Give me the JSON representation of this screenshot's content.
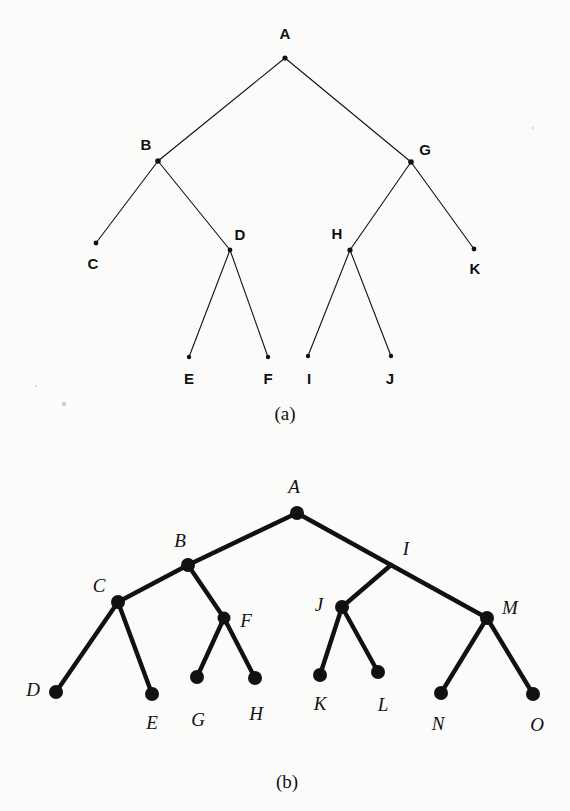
{
  "figure": {
    "background_color": "#fbfbfa",
    "ink_color": "#111111"
  },
  "panel_a": {
    "caption": "(a)",
    "caption_x": 285,
    "caption_y": 414,
    "style": "thin-lines-bold-sans-labels",
    "nodes": [
      {
        "id": "A",
        "label": "A",
        "x": 285,
        "y": 58,
        "label_x": 285,
        "label_y": 33,
        "dot_r": 2.6
      },
      {
        "id": "B",
        "label": "B",
        "x": 158,
        "y": 161,
        "label_x": 146,
        "label_y": 144,
        "dot_r": 2.8
      },
      {
        "id": "G",
        "label": "G",
        "x": 411,
        "y": 162,
        "label_x": 425,
        "label_y": 149,
        "dot_r": 2.8
      },
      {
        "id": "C",
        "label": "C",
        "x": 96,
        "y": 243,
        "label_x": 93,
        "label_y": 263,
        "dot_r": 2.4
      },
      {
        "id": "D",
        "label": "D",
        "x": 230,
        "y": 250,
        "label_x": 240,
        "label_y": 234,
        "dot_r": 2.4
      },
      {
        "id": "H",
        "label": "H",
        "x": 350,
        "y": 250,
        "label_x": 337,
        "label_y": 233,
        "dot_r": 2.6
      },
      {
        "id": "K",
        "label": "K",
        "x": 474,
        "y": 249,
        "label_x": 475,
        "label_y": 268,
        "dot_r": 2.4
      },
      {
        "id": "E",
        "label": "E",
        "x": 189,
        "y": 357,
        "label_x": 189,
        "label_y": 378,
        "dot_r": 2.2
      },
      {
        "id": "F",
        "label": "F",
        "x": 268,
        "y": 357,
        "label_x": 268,
        "label_y": 378,
        "dot_r": 2.2
      },
      {
        "id": "I",
        "label": "I",
        "x": 308,
        "y": 356,
        "label_x": 309,
        "label_y": 378,
        "dot_r": 2.2
      },
      {
        "id": "J",
        "label": "J",
        "x": 391,
        "y": 356,
        "label_x": 390,
        "label_y": 378,
        "dot_r": 2.2
      }
    ],
    "edges": [
      [
        "A",
        "B"
      ],
      [
        "A",
        "G"
      ],
      [
        "B",
        "C"
      ],
      [
        "B",
        "D"
      ],
      [
        "G",
        "H"
      ],
      [
        "G",
        "K"
      ],
      [
        "D",
        "E"
      ],
      [
        "D",
        "F"
      ],
      [
        "H",
        "I"
      ],
      [
        "H",
        "J"
      ]
    ],
    "edge_width": 1.1
  },
  "panel_b": {
    "caption": "(b)",
    "caption_x": 287,
    "caption_y": 782,
    "style": "thick-lines-italic-serif-labels",
    "nodes": [
      {
        "id": "A",
        "label": "A",
        "x": 297,
        "y": 513,
        "label_x": 294,
        "label_y": 486,
        "dot_r": 7.0
      },
      {
        "id": "B",
        "label": "B",
        "x": 188,
        "y": 565,
        "label_x": 180,
        "label_y": 540,
        "dot_r": 7.0
      },
      {
        "id": "I",
        "label": "I",
        "x": 391,
        "y": 565,
        "label_x": 406,
        "label_y": 548,
        "dot_r": 0.0
      },
      {
        "id": "C",
        "label": "C",
        "x": 118,
        "y": 602,
        "label_x": 99,
        "label_y": 585,
        "dot_r": 7.0
      },
      {
        "id": "F",
        "label": "F",
        "x": 224,
        "y": 618,
        "label_x": 246,
        "label_y": 620,
        "dot_r": 6.5
      },
      {
        "id": "J",
        "label": "J",
        "x": 342,
        "y": 607,
        "label_x": 319,
        "label_y": 604,
        "dot_r": 7.0
      },
      {
        "id": "M",
        "label": "M",
        "x": 487,
        "y": 618,
        "label_x": 510,
        "label_y": 607,
        "dot_r": 7.0
      },
      {
        "id": "D",
        "label": "D",
        "x": 56,
        "y": 692,
        "label_x": 33,
        "label_y": 689,
        "dot_r": 7.0
      },
      {
        "id": "E",
        "label": "E",
        "x": 152,
        "y": 694,
        "label_x": 152,
        "label_y": 722,
        "dot_r": 7.0
      },
      {
        "id": "G",
        "label": "G",
        "x": 197,
        "y": 677,
        "label_x": 198,
        "label_y": 719,
        "dot_r": 7.0
      },
      {
        "id": "H",
        "label": "H",
        "x": 255,
        "y": 678,
        "label_x": 256,
        "label_y": 713,
        "dot_r": 7.0
      },
      {
        "id": "K",
        "label": "K",
        "x": 320,
        "y": 675,
        "label_x": 320,
        "label_y": 703,
        "dot_r": 7.0
      },
      {
        "id": "L",
        "label": "L",
        "x": 378,
        "y": 672,
        "label_x": 383,
        "label_y": 704,
        "dot_r": 7.0
      },
      {
        "id": "N",
        "label": "N",
        "x": 441,
        "y": 693,
        "label_x": 438,
        "label_y": 723,
        "dot_r": 7.0
      },
      {
        "id": "O",
        "label": "O",
        "x": 533,
        "y": 694,
        "label_x": 537,
        "label_y": 724,
        "dot_r": 7.0
      }
    ],
    "edges": [
      [
        "A",
        "B"
      ],
      [
        "A",
        "I"
      ],
      [
        "B",
        "C"
      ],
      [
        "B",
        "F"
      ],
      [
        "C",
        "D"
      ],
      [
        "C",
        "E"
      ],
      [
        "F",
        "G"
      ],
      [
        "F",
        "H"
      ],
      [
        "I",
        "J"
      ],
      [
        "I",
        "M"
      ],
      [
        "J",
        "K"
      ],
      [
        "J",
        "L"
      ],
      [
        "M",
        "N"
      ],
      [
        "M",
        "O"
      ]
    ],
    "edge_width": 4.4
  },
  "specks": [
    {
      "x": 533,
      "y": 128,
      "r": 1.3
    },
    {
      "x": 64,
      "y": 404,
      "r": 1.6
    },
    {
      "x": 36,
      "y": 386,
      "r": 1.2
    }
  ]
}
